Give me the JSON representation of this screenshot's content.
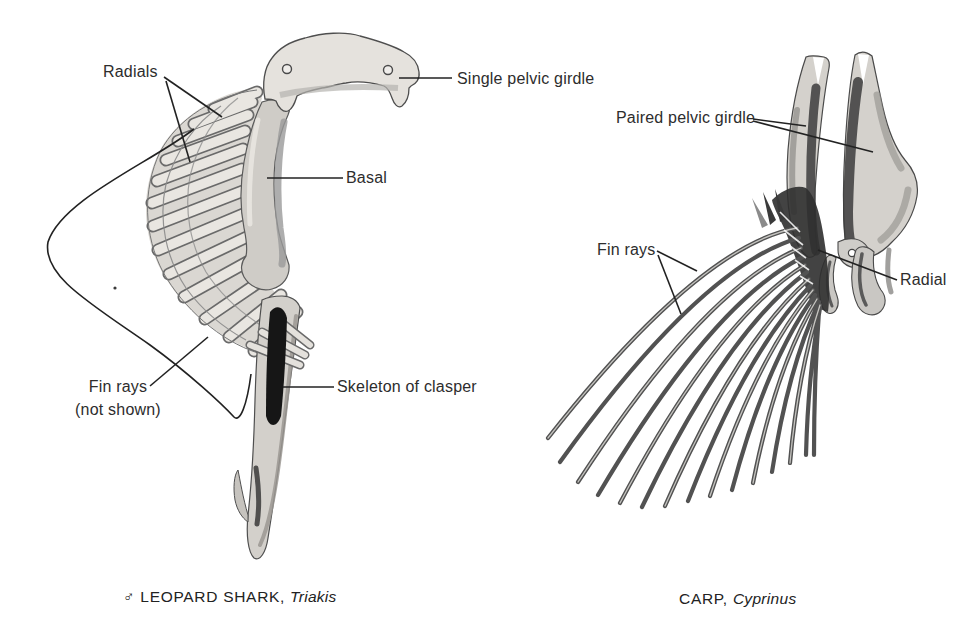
{
  "page": {
    "background": "#ffffff",
    "ink": "#2d2d2d"
  },
  "shark_panel": {
    "labels": {
      "radials": "Radials",
      "single_pelvic_girdle": "Single pelvic girdle",
      "basal": "Basal",
      "fin_rays_line1": "Fin rays",
      "fin_rays_line2": "(not shown)",
      "skeleton_of_clasper": "Skeleton of clasper"
    },
    "caption": {
      "sex_symbol": "♂",
      "common_name": "LEOPARD SHARK,",
      "genus": "Triakis"
    }
  },
  "carp_panel": {
    "labels": {
      "paired_pelvic_girdle": "Paired pelvic girdle",
      "fin_rays": "Fin rays",
      "radial": "Radial"
    },
    "caption": {
      "common_name": "CARP,",
      "genus": "Cyprinus"
    }
  }
}
